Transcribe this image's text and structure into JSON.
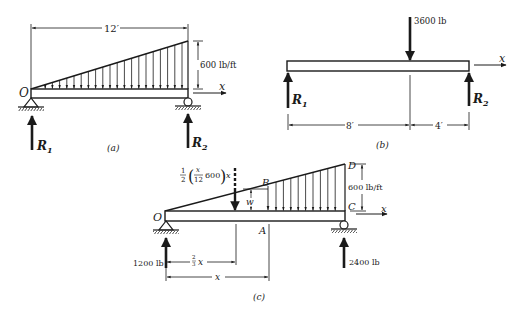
{
  "figure_a": {
    "caption": "(a)",
    "span_label": "12′",
    "load_label": "600 lb/ft",
    "origin_label": "O",
    "axis_label": "x",
    "reaction_left": {
      "sym": "R",
      "sub": "1"
    },
    "reaction_right": {
      "sym": "R",
      "sub": "2"
    }
  },
  "figure_b": {
    "caption": "(b)",
    "point_load_label": "3600 lb",
    "axis_label": "x",
    "left_span_label": "8′",
    "right_span_label": "4′",
    "reaction_left": {
      "sym": "R",
      "sub": "1"
    },
    "reaction_right": {
      "sym": "R",
      "sub": "2"
    }
  },
  "figure_c": {
    "caption": "(c)",
    "resultant_label": {
      "half": "1",
      "half_den": "2",
      "frac_num": "x",
      "frac_den": "12",
      "value": "600",
      "tail": "x"
    },
    "load_label": "600 lb/ft",
    "axis_label": "x",
    "point_labels": {
      "O": "O",
      "A": "A",
      "B": "B",
      "C": "C",
      "D": "D",
      "w": "w"
    },
    "reaction_left_label": "1200 lb",
    "reaction_right_label": "2400 lb",
    "centroid_dim": {
      "num": "2",
      "den": "3",
      "var": "x"
    },
    "x_dim_label": "x"
  }
}
